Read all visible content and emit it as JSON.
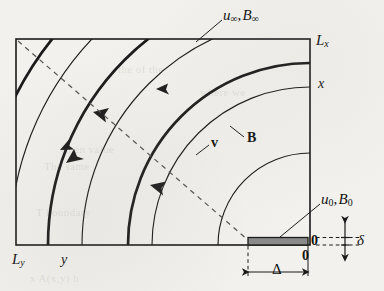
{
  "figure": {
    "type": "physics-schematic",
    "background_color": "#f2f1ed",
    "ink_color": "#1a1a1a",
    "slab_fill_color": "#8a8a8a"
  },
  "labels": {
    "top_inflow": {
      "u": "u",
      "u_sub": "∞",
      "sep": ",",
      "b": "B",
      "b_sub": "∞"
    },
    "corner_lx": {
      "base": "L",
      "sub": "x"
    },
    "corner_ly": {
      "base": "L",
      "sub": "y"
    },
    "axis_x": "x",
    "axis_y": "y",
    "field_b": "B",
    "velocity_v": "v",
    "inlet": {
      "u": "u",
      "u_sub": "0",
      "sep": ",",
      "b": "B",
      "b_sub": "0"
    },
    "origin_right": "0",
    "origin_bottom": "0",
    "delta": "δ",
    "width_delta": "Δ"
  },
  "geometry": {
    "frame": {
      "left": 16,
      "top": 39,
      "right": 310,
      "bottom": 245
    },
    "arc_center": {
      "x": 310,
      "y": 245
    },
    "v_arc_radii": [
      182,
      262,
      330
    ],
    "b_arc_radii": [
      92,
      158,
      228,
      300
    ],
    "slab": {
      "x": 248,
      "y": 238,
      "width": 60,
      "height": 7
    },
    "dashed_diagonal": {
      "x1": 18,
      "y1": 41,
      "x2": 248,
      "y2": 240
    }
  },
  "ghost_text": {
    "line1": "the of the",
    "line2": "where we",
    "line3": "when value",
    "line4": "The same",
    "line5": "T boundary",
    "line6": "x A(x,y) h"
  }
}
